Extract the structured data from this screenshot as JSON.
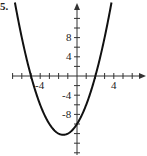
{
  "problem_number": "5.",
  "chart_data": {
    "type": "line",
    "title": "",
    "function": "y = x^2 + 3x - 10",
    "xlabel": "",
    "ylabel": "",
    "x_tick_labels": [
      "-4",
      "4"
    ],
    "y_tick_labels": [
      "8",
      "4",
      "-4",
      "-8"
    ],
    "x_tick_step": 1,
    "y_tick_step": 2,
    "xlim": [
      -7,
      7
    ],
    "ylim": [
      -16,
      15
    ],
    "grid": false,
    "key_points": {
      "x_intercepts": [
        -5,
        2
      ],
      "y_intercept": -10,
      "vertex": [
        -1.5,
        -12.25
      ]
    },
    "x": [
      -7,
      -6,
      -5,
      -4,
      -3,
      -2,
      -1.5,
      -1,
      0,
      1,
      2,
      3,
      4
    ],
    "values": [
      18,
      8,
      0,
      -6,
      -10,
      -12,
      -12.25,
      -12,
      -10,
      -6,
      0,
      8,
      18
    ]
  },
  "colors": {
    "curve": "#111111",
    "axis": "#333333",
    "text": "#222222"
  }
}
